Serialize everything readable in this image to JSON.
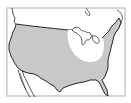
{
  "map": {
    "title": "Range map",
    "region": "Continental United States",
    "colors": {
      "background": "#ffffff",
      "frame": "#9a9a9a",
      "range_fill": "#c8c8c8",
      "excluded_fill": "#ffffff",
      "outline": "#111111"
    },
    "legend": {
      "range_label": "Range (shaded)",
      "excluded_label": "Absent (unshaded)"
    }
  }
}
